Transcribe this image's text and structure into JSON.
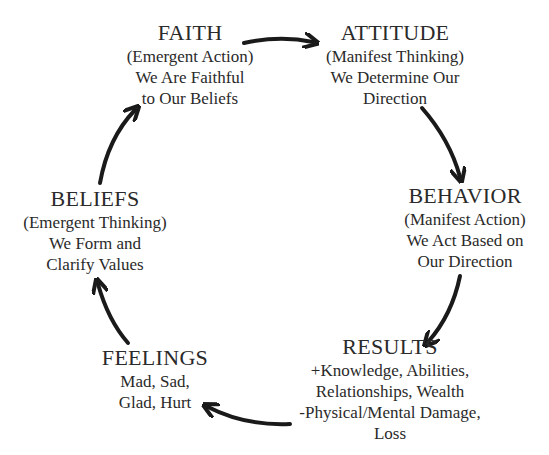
{
  "diagram": {
    "type": "cycle",
    "nodes": [
      {
        "id": "faith",
        "title": "FAITH",
        "subtitle": "(Emergent Action)",
        "lines": [
          "We Are Faithful",
          "to Our Beliefs"
        ]
      },
      {
        "id": "attitude",
        "title": "ATTITUDE",
        "subtitle": "(Manifest Thinking)",
        "lines": [
          "We Determine Our",
          "Direction"
        ]
      },
      {
        "id": "behavior",
        "title": "BEHAVIOR",
        "subtitle": "(Manifest Action)",
        "lines": [
          "We Act Based on",
          "Our Direction"
        ]
      },
      {
        "id": "results",
        "title": "RESULTS",
        "subtitle": "",
        "lines": [
          "+Knowledge, Abilities,",
          "Relationships, Wealth",
          "-Physical/Mental Damage,",
          "Loss"
        ]
      },
      {
        "id": "feelings",
        "title": "FEELINGS",
        "subtitle": "",
        "lines": [
          "Mad, Sad,",
          "Glad, Hurt"
        ]
      },
      {
        "id": "beliefs",
        "title": "BELIEFS",
        "subtitle": "(Emergent Thinking)",
        "lines": [
          "We Form and",
          "Clarify Values"
        ]
      }
    ],
    "edges": [
      {
        "from": "faith",
        "to": "attitude"
      },
      {
        "from": "attitude",
        "to": "behavior"
      },
      {
        "from": "behavior",
        "to": "results"
      },
      {
        "from": "results",
        "to": "feelings"
      },
      {
        "from": "feelings",
        "to": "beliefs"
      },
      {
        "from": "beliefs",
        "to": "faith"
      }
    ],
    "colors": {
      "text": "#2a2a2a",
      "arrow": "#1a1a1a",
      "background": "#ffffff"
    }
  }
}
